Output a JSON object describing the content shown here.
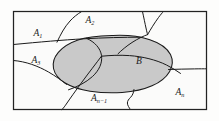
{
  "figure": {
    "type": "set-partition-venn-diagram",
    "caption": "",
    "universe_label": "",
    "colors": {
      "shaded_fill": "#c9c9c9",
      "background_fill": "#fbfbfa",
      "stroke": "#1a1a1a",
      "frame_stroke": "#222222",
      "page_background": "#fdfdfc"
    },
    "frame": {
      "x": 13,
      "y": 11,
      "width": 194,
      "height": 99
    },
    "labels": [
      {
        "id": "A1",
        "base": "A",
        "sub": "1",
        "x": 38,
        "y": 36,
        "name": "label-a1"
      },
      {
        "id": "A2",
        "base": "A",
        "sub": "2",
        "x": 90,
        "y": 23,
        "name": "label-a2"
      },
      {
        "id": "A3",
        "base": "A",
        "sub": "3",
        "x": 36,
        "y": 63,
        "name": "label-a3"
      },
      {
        "id": "B",
        "base": "B",
        "sub": "",
        "x": 139,
        "y": 64,
        "name": "label-b"
      },
      {
        "id": "An-1",
        "base": "A",
        "sub": "n−1",
        "x": 99,
        "y": 101,
        "name": "label-an-minus-1"
      },
      {
        "id": "An",
        "base": "A",
        "sub": "n",
        "x": 180,
        "y": 95,
        "name": "label-an"
      }
    ],
    "shaded_region": {
      "name": "event-b-ellipse",
      "description": "B"
    },
    "partition_curves": [
      {
        "name": "partition-curve-a1-a2"
      },
      {
        "name": "partition-curve-a1-a3"
      },
      {
        "name": "partition-curve-a2-upper-right"
      },
      {
        "name": "partition-curve-a3-lower"
      },
      {
        "name": "partition-curve-an-minus-1"
      },
      {
        "name": "partition-curve-an"
      },
      {
        "name": "partition-curve-inner-left"
      },
      {
        "name": "partition-curve-inner-right"
      },
      {
        "name": "partition-curve-bottom-wavy"
      }
    ]
  }
}
